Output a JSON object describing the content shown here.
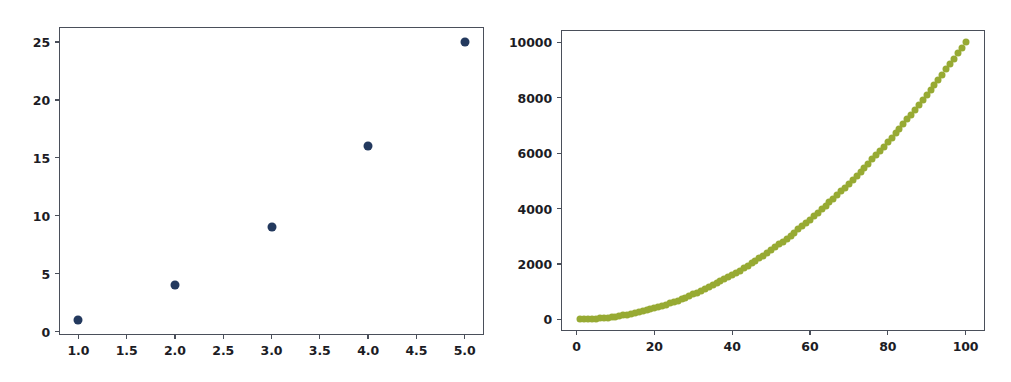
{
  "figure": {
    "background_color": "#ffffff",
    "width": 1011,
    "height": 382,
    "panel_count": 2
  },
  "chart_data": [
    {
      "type": "scatter",
      "title": "",
      "xlabel": "",
      "ylabel": "",
      "x": [
        1,
        2,
        3,
        4,
        5
      ],
      "y": [
        1,
        4,
        9,
        16,
        25
      ],
      "series": [
        {
          "name": "y = x^2",
          "color": "#23395e",
          "marker": "circle",
          "values": [
            1,
            4,
            9,
            16,
            25
          ]
        }
      ],
      "xlim": [
        0.8,
        5.2
      ],
      "ylim": [
        -0.3,
        26.3
      ],
      "xticks": [
        1.0,
        1.5,
        2.0,
        2.5,
        3.0,
        3.5,
        4.0,
        4.5,
        5.0
      ],
      "yticks": [
        0,
        5,
        10,
        15,
        20,
        25
      ],
      "xticklabels": [
        "1.0",
        "1.5",
        "2.0",
        "2.5",
        "3.0",
        "3.5",
        "4.0",
        "4.5",
        "5.0"
      ],
      "yticklabels": [
        "0",
        "5",
        "10",
        "15",
        "20",
        "25"
      ],
      "grid": false,
      "legend": false
    },
    {
      "type": "scatter",
      "title": "",
      "xlabel": "",
      "ylabel": "",
      "series": [
        {
          "name": "y = x^2",
          "color": "#97aa33",
          "marker": "circle",
          "x_start": 1,
          "x_end": 100,
          "x_step": 1,
          "formula": "y = x^2",
          "y_start": 1,
          "y_end": 10000
        }
      ],
      "xlim": [
        -4,
        105
      ],
      "ylim": [
        -420,
        10450
      ],
      "xticks": [
        0,
        20,
        40,
        60,
        80,
        100
      ],
      "yticks": [
        0,
        2000,
        4000,
        6000,
        8000,
        10000
      ],
      "xticklabels": [
        "0",
        "20",
        "40",
        "60",
        "80",
        "100"
      ],
      "yticklabels": [
        "0",
        "2000",
        "4000",
        "6000",
        "8000",
        "10000"
      ],
      "grid": false,
      "legend": false
    }
  ]
}
